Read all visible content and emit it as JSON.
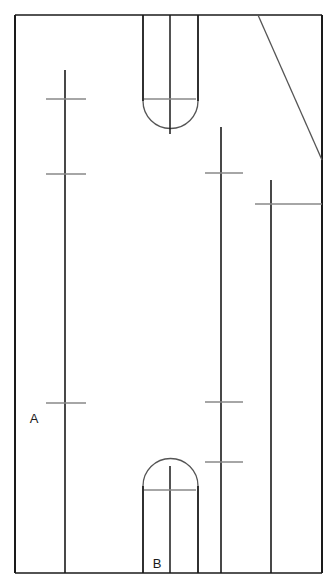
{
  "drawing": {
    "title": "Mechanical part outline with two slots and chamfer",
    "canvas": {
      "width": 331,
      "height": 586
    },
    "colors": {
      "outline": "#1a1a1a",
      "arc": "#555555",
      "centerline": "#1a1a1a",
      "tick": "#888888",
      "chamfer": "#555555",
      "background": "#ffffff"
    },
    "labels": [
      {
        "name": "label-a",
        "text": "A",
        "x": 34,
        "y": 423
      },
      {
        "name": "label-b",
        "text": "B",
        "x": 157,
        "y": 568
      }
    ],
    "outline": {
      "left": 15,
      "top": 15,
      "right": 322,
      "bottom": 573
    },
    "chamfer": {
      "x1": 258,
      "y1": 15,
      "x2": 322,
      "y2": 160
    },
    "top_slot": {
      "left_x": 143,
      "right_x": 198,
      "top_y": 15,
      "arc_center_y": 101,
      "radius": 27,
      "centerline_x": 170,
      "centerline_top": 15,
      "centerline_bottom": 134,
      "tick_y": 99,
      "tick_half_width": 26
    },
    "bottom_slot": {
      "left_x": 143,
      "right_x": 198,
      "bottom_y": 573,
      "arc_center_y": 486,
      "radius": 27,
      "centerline_x": 170,
      "centerline_top": 466,
      "centerline_bottom": 573,
      "tick_y": 490,
      "tick_half_width": 26
    },
    "center_lines": [
      {
        "name": "centerline-a",
        "x": 65,
        "y_top": 70,
        "y_bottom": 573,
        "ticks": [
          {
            "y": 99,
            "x_left": 46,
            "x_right": 86
          },
          {
            "y": 174,
            "x_left": 46,
            "x_right": 86
          },
          {
            "y": 403,
            "x_left": 46,
            "x_right": 86
          }
        ]
      },
      {
        "name": "centerline-middle",
        "x": 221,
        "y_top": 127,
        "y_bottom": 573,
        "ticks": [
          {
            "y": 173,
            "x_left": 205,
            "x_right": 243
          },
          {
            "y": 402,
            "x_left": 205,
            "x_right": 243
          },
          {
            "y": 462,
            "x_left": 205,
            "x_right": 243
          }
        ]
      },
      {
        "name": "centerline-right",
        "x": 271,
        "y_top": 180,
        "y_bottom": 573,
        "ticks": [
          {
            "y": 204,
            "x_left": 255,
            "x_right": 322
          }
        ]
      }
    ]
  }
}
